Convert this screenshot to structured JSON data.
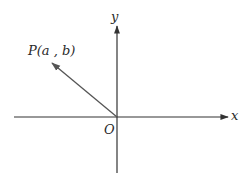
{
  "diagram": {
    "type": "coordinate-plane",
    "axes": {
      "x_label": "x",
      "y_label": "y",
      "origin_label": "O"
    },
    "point": {
      "label": "P(a , b)",
      "name": "P",
      "coords": [
        "a",
        "b"
      ],
      "quadrant": 2
    },
    "vector": {
      "from": "O",
      "to": "P"
    },
    "colors": {
      "axis": "#333333",
      "vector": "#555555",
      "text": "#2a2a2a"
    }
  }
}
